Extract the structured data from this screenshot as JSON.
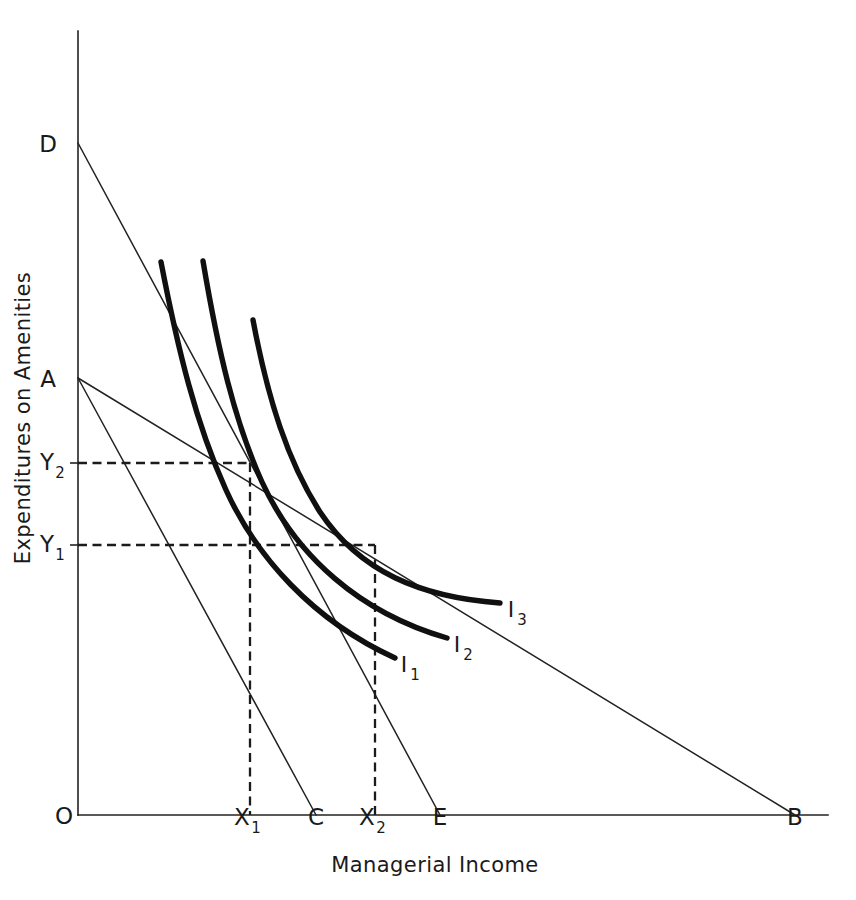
{
  "figure": {
    "kind": "indifference-curve-diagram",
    "background_color": "#ffffff",
    "ink_color": "#1a1a1a"
  },
  "axes": {
    "x_title": "Managerial Income",
    "y_title": "Expenditures on Amenities",
    "origin_label": "O"
  },
  "point_labels": {
    "origin": "O",
    "a": "A",
    "b": "B",
    "c": "C",
    "d": "D",
    "e": "E",
    "x1_base": "X",
    "x1_sub": "1",
    "x2_base": "X",
    "x2_sub": "2",
    "y1_base": "Y",
    "y1_sub": "1",
    "y2_base": "Y",
    "y2_sub": "2"
  },
  "curves": [
    {
      "name": "I1",
      "base": "I",
      "sub": "1",
      "label_x": 404,
      "label_y": 672
    },
    {
      "name": "I2",
      "base": "I",
      "sub": "2",
      "label_x": 457,
      "label_y": 652
    },
    {
      "name": "I3",
      "base": "I",
      "sub": "3",
      "label_x": 511,
      "label_y": 617
    }
  ],
  "chart_data": {
    "type": "line",
    "title": "",
    "xlabel": "Managerial Income",
    "ylabel": "Expenditures on Amenities",
    "grid": false,
    "legend": "inline-curve-labels",
    "axis_geometry": {
      "origin_px": [
        78,
        815
      ],
      "y_axis_top_px": [
        78,
        31
      ],
      "x_axis_right_px": [
        828,
        815
      ]
    },
    "marked_points": {
      "O": [
        78,
        815
      ],
      "A": [
        78,
        378
      ],
      "D": [
        78,
        143
      ],
      "C": [
        316,
        815
      ],
      "E": [
        440,
        815
      ],
      "B": [
        795,
        815
      ],
      "X1": [
        250,
        815
      ],
      "X2": [
        375,
        815
      ],
      "Y1": [
        78,
        545
      ],
      "Y2": [
        78,
        463
      ]
    },
    "budget_lines": [
      {
        "name": "AC",
        "from": "A",
        "to": "C",
        "from_px": [
          78,
          378
        ],
        "to_px": [
          316,
          815
        ]
      },
      {
        "name": "AB",
        "from": "A",
        "to": "B",
        "from_px": [
          78,
          378
        ],
        "to_px": [
          795,
          815
        ]
      },
      {
        "name": "DE",
        "from": "D",
        "to": "E",
        "from_px": [
          78,
          143
        ],
        "to_px": [
          440,
          815
        ]
      }
    ],
    "tangencies": [
      {
        "curve": "I2",
        "budget_line": "AC",
        "point": [
          250,
          463
        ],
        "x_label": "X1",
        "y_label": "Y2"
      },
      {
        "curve": "I3",
        "budget_line": "AB",
        "point": [
          375,
          545
        ],
        "x_label": "X2",
        "y_label": "Y1"
      }
    ],
    "series": [
      {
        "name": "I1",
        "path": "M 161 262 C 178 350 196 424 226 490 C 256 556 312 620 395 658"
      },
      {
        "name": "I2",
        "path": "M 203 261 C 218 350 234 420 262 482 C 296 556 360 613 447 638"
      },
      {
        "name": "I3",
        "path": "M 253 320 C 268 400 288 462 320 512 C 360 572 420 597 500 603"
      }
    ],
    "dashed_guides": [
      {
        "from_px": [
          78,
          463
        ],
        "to_px": [
          250,
          463
        ],
        "orientation": "horizontal",
        "to_label": "Y2"
      },
      {
        "from_px": [
          250,
          463
        ],
        "to_px": [
          250,
          815
        ],
        "orientation": "vertical",
        "to_label": "X1"
      },
      {
        "from_px": [
          78,
          545
        ],
        "to_px": [
          375,
          545
        ],
        "orientation": "horizontal",
        "to_label": "Y1"
      },
      {
        "from_px": [
          375,
          545
        ],
        "to_px": [
          375,
          815
        ],
        "orientation": "vertical",
        "to_label": "X2"
      }
    ]
  }
}
